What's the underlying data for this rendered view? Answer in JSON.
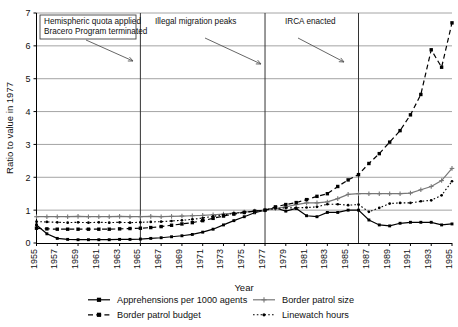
{
  "chart_data": {
    "type": "line",
    "title": "",
    "xlabel": "Year",
    "ylabel": "Ratio to value in 1977",
    "xlim": [
      1955,
      1995
    ],
    "ylim": [
      0,
      7
    ],
    "yticks": [
      0,
      1,
      2,
      3,
      4,
      5,
      6,
      7
    ],
    "xticks": [
      1955,
      1957,
      1959,
      1961,
      1963,
      1965,
      1967,
      1969,
      1971,
      1973,
      1975,
      1977,
      1979,
      1981,
      1983,
      1985,
      1987,
      1989,
      1991,
      1993,
      1995
    ],
    "grid": "horizontal",
    "legend_position": "bottom",
    "x": [
      1955,
      1956,
      1957,
      1958,
      1959,
      1960,
      1961,
      1962,
      1963,
      1964,
      1965,
      1966,
      1967,
      1968,
      1969,
      1970,
      1971,
      1972,
      1973,
      1974,
      1975,
      1976,
      1977,
      1978,
      1979,
      1980,
      1981,
      1982,
      1983,
      1984,
      1985,
      1986,
      1987,
      1988,
      1989,
      1990,
      1991,
      1992,
      1993,
      1994,
      1995
    ],
    "series": [
      {
        "name": "Apprehensions per 1000 agents",
        "marker": "filled-square",
        "linestyle": "solid",
        "color": "#000000",
        "values": [
          0.55,
          0.28,
          0.14,
          0.11,
          0.1,
          0.1,
          0.1,
          0.1,
          0.11,
          0.11,
          0.12,
          0.14,
          0.16,
          0.19,
          0.22,
          0.26,
          0.33,
          0.42,
          0.55,
          0.68,
          0.8,
          0.92,
          1.0,
          1.07,
          0.97,
          1.05,
          0.83,
          0.8,
          0.93,
          0.93,
          1.0,
          1.0,
          0.7,
          0.55,
          0.52,
          0.6,
          0.63,
          0.63,
          0.63,
          0.55,
          0.58
        ]
      },
      {
        "name": "Border patrol size",
        "marker": "plus",
        "linestyle": "solid",
        "color": "#777777",
        "values": [
          0.8,
          0.8,
          0.8,
          0.8,
          0.81,
          0.8,
          0.8,
          0.8,
          0.81,
          0.8,
          0.8,
          0.81,
          0.8,
          0.81,
          0.82,
          0.83,
          0.84,
          0.86,
          0.88,
          0.91,
          0.94,
          0.97,
          1.0,
          1.05,
          1.1,
          1.17,
          1.22,
          1.22,
          1.25,
          1.35,
          1.48,
          1.5,
          1.5,
          1.5,
          1.5,
          1.5,
          1.52,
          1.62,
          1.72,
          1.9,
          2.27
        ]
      },
      {
        "name": "Border patrol budget",
        "marker": "filled-square",
        "linestyle": "dashed",
        "color": "#000000",
        "values": [
          0.45,
          0.43,
          0.42,
          0.42,
          0.42,
          0.42,
          0.42,
          0.42,
          0.43,
          0.44,
          0.45,
          0.47,
          0.5,
          0.54,
          0.58,
          0.62,
          0.68,
          0.75,
          0.82,
          0.88,
          0.93,
          0.97,
          1.0,
          1.1,
          1.17,
          1.23,
          1.32,
          1.42,
          1.5,
          1.72,
          1.92,
          2.08,
          2.42,
          2.72,
          3.07,
          3.42,
          3.9,
          4.52,
          5.88,
          5.35,
          6.7
        ]
      },
      {
        "name": "Linewatch hours",
        "marker": "small-dot",
        "linestyle": "dotted",
        "color": "#000000",
        "values": [
          0.65,
          0.64,
          0.63,
          0.62,
          0.63,
          0.62,
          0.63,
          0.62,
          0.63,
          0.62,
          0.63,
          0.64,
          0.65,
          0.67,
          0.69,
          0.72,
          0.76,
          0.81,
          0.86,
          0.9,
          0.94,
          0.97,
          1.0,
          1.05,
          1.07,
          1.07,
          1.08,
          1.1,
          1.18,
          1.18,
          1.15,
          1.17,
          0.95,
          1.07,
          1.2,
          1.22,
          1.22,
          1.27,
          1.3,
          1.45,
          1.88
        ]
      }
    ],
    "annotations": [
      {
        "id": "hemispheric",
        "text_line1": "Hemispheric quota applied",
        "text_line2": "Bracero Program terminated",
        "event_year": 1965
      },
      {
        "id": "illegal-migration",
        "text_line1": "Illegal migration peaks",
        "text_line2": "",
        "event_year": 1977
      },
      {
        "id": "irca",
        "text_line1": "IRCA enacted",
        "text_line2": "",
        "event_year": 1986
      }
    ],
    "event_lines": [
      1965,
      1977,
      1986
    ]
  },
  "legend": {
    "items": [
      {
        "label": "Apprehensions per 1000 agents",
        "marker_name": "solid-line-square-marker"
      },
      {
        "label": "Border patrol size",
        "marker_name": "solid-line-plus-marker"
      },
      {
        "label": "Border patrol budget",
        "marker_name": "dashed-line-square-marker"
      },
      {
        "label": "Linewatch hours",
        "marker_name": "dotted-line-dot-marker"
      }
    ]
  },
  "colors": {
    "series_black": "#000000",
    "series_gray": "#777777",
    "grid": "#9a9a9a",
    "axis": "#000000",
    "annotation_arrow": "#555555",
    "background": "#ffffff"
  }
}
